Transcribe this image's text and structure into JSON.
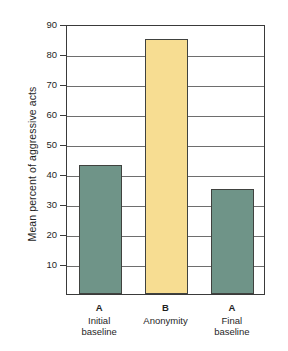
{
  "chart_data": {
    "type": "bar",
    "title": "",
    "xlabel": "",
    "ylabel": "Mean percent of aggressive acts",
    "ylim": [
      0,
      90
    ],
    "ytick_step": 10,
    "yticks": [
      90,
      80,
      70,
      60,
      50,
      40,
      30,
      20,
      10
    ],
    "grid": "horizontal",
    "legend": "none",
    "categories": [
      "A\nInitial baseline",
      "B\nAnonymity",
      "A\nFinal baseline"
    ],
    "category_keys": [
      "A",
      "B",
      "A"
    ],
    "category_names": [
      "Initial\nbaseline",
      "Anonymity",
      "Final\nbaseline"
    ],
    "values": [
      43,
      85,
      35
    ],
    "bar_colors": [
      "#6f9488",
      "#f7dd92",
      "#6f9488"
    ],
    "bar_border_color": "#40423f",
    "gridline_color": "#6e6e6e",
    "frame_color": "#3a3a3a",
    "background": "#ffffff"
  }
}
